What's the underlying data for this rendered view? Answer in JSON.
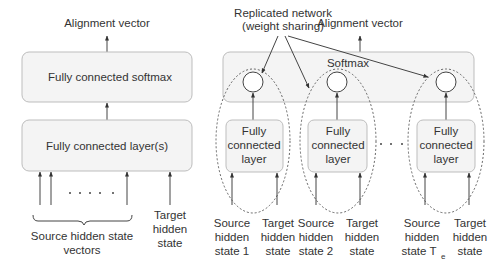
{
  "left_diagram": {
    "output_label": "Alignment vector",
    "softmax_box_label": "Fully connected softmax",
    "fc_box_label": "Fully connected layer(s)",
    "ellipsis": "· · · · ·",
    "source_label_line1": "Source hidden state",
    "source_label_line2": "vectors",
    "target_label_line1": "Target",
    "target_label_line2": "hidden",
    "target_label_line3": "state"
  },
  "right_diagram": {
    "annotation_line1": "Replicated network",
    "annotation_line2": "(weight sharing)",
    "output_label": "Alignment vector",
    "softmax_box_label": "Softmax",
    "ellipsis": "· · ·",
    "modules": [
      {
        "fc_line1": "Fully",
        "fc_line2": "connected",
        "fc_line3": "layer",
        "source_line1": "Source",
        "source_line2": "hidden",
        "source_line3": "state 1",
        "target_line1": "Target",
        "target_line2": "hidden",
        "target_line3": "state"
      },
      {
        "fc_line1": "Fully",
        "fc_line2": "connected",
        "fc_line3": "layer",
        "source_line1": "Source",
        "source_line2": "hidden",
        "source_line3": "state 2",
        "target_line1": "Target",
        "target_line2": "hidden",
        "target_line3": "state"
      },
      {
        "fc_line1": "Fully",
        "fc_line2": "connected",
        "fc_line3": "layer",
        "source_line1": "Source",
        "source_line2": "hidden",
        "source_line3": "state T",
        "source_subscript": "e",
        "target_line1": "Target",
        "target_line2": "hidden",
        "target_line3": "state"
      }
    ]
  }
}
